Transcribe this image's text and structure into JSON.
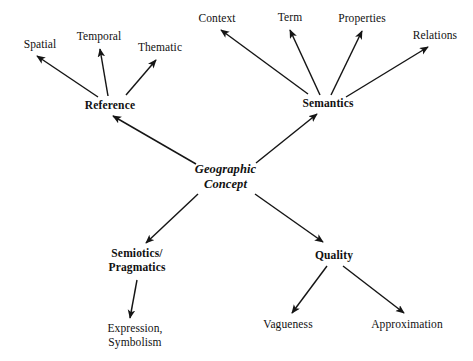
{
  "diagram": {
    "type": "concept-map",
    "background_color": "#ffffff",
    "text_color": "#111111",
    "arrow_color": "#151515",
    "nodes": {
      "center": {
        "label": "Geographic\nConcept",
        "style": "bold-italic"
      },
      "reference": {
        "label": "Reference",
        "style": "bold"
      },
      "semantics": {
        "label": "Semantics",
        "style": "bold"
      },
      "semiotics": {
        "label": "Semiotics/\nPragmatics",
        "style": "bold"
      },
      "quality": {
        "label": "Quality",
        "style": "bold"
      },
      "spatial": {
        "label": "Spatial",
        "style": "regular"
      },
      "temporal": {
        "label": "Temporal",
        "style": "regular"
      },
      "thematic": {
        "label": "Thematic",
        "style": "regular"
      },
      "context": {
        "label": "Context",
        "style": "regular"
      },
      "term": {
        "label": "Term",
        "style": "regular"
      },
      "properties": {
        "label": "Properties",
        "style": "regular"
      },
      "relations": {
        "label": "Relations",
        "style": "regular"
      },
      "expression": {
        "label": "Expression,\nSymbolism",
        "style": "regular"
      },
      "vagueness": {
        "label": "Vagueness",
        "style": "regular"
      },
      "approximation": {
        "label": "Approximation",
        "style": "regular"
      }
    },
    "edges": [
      {
        "from": "center",
        "to": "reference"
      },
      {
        "from": "center",
        "to": "semantics"
      },
      {
        "from": "center",
        "to": "semiotics"
      },
      {
        "from": "center",
        "to": "quality"
      },
      {
        "from": "reference",
        "to": "spatial"
      },
      {
        "from": "reference",
        "to": "temporal"
      },
      {
        "from": "reference",
        "to": "thematic"
      },
      {
        "from": "semantics",
        "to": "context"
      },
      {
        "from": "semantics",
        "to": "term"
      },
      {
        "from": "semantics",
        "to": "properties"
      },
      {
        "from": "semantics",
        "to": "relations"
      },
      {
        "from": "semiotics",
        "to": "expression"
      },
      {
        "from": "quality",
        "to": "vagueness"
      },
      {
        "from": "quality",
        "to": "approximation"
      }
    ]
  }
}
